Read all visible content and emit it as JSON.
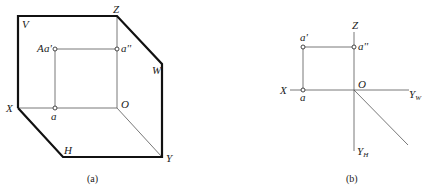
{
  "figure_a": {
    "caption": "(a)",
    "labels": {
      "V": "V",
      "Z": "Z",
      "W": "W",
      "X": "X",
      "H": "H",
      "Y": "Y",
      "O": "O",
      "A": "A",
      "a_prime": "a'",
      "a_double_prime": "a''",
      "a": "a"
    }
  },
  "figure_b": {
    "caption": "(b)",
    "labels": {
      "Z": "Z",
      "X": "X",
      "O": "O",
      "Y_W": "Y",
      "Y_W_sub": "W",
      "Y_H": "Y",
      "Y_H_sub": "H",
      "a_prime": "a'",
      "a_double_prime": "a''",
      "a": "a"
    }
  }
}
